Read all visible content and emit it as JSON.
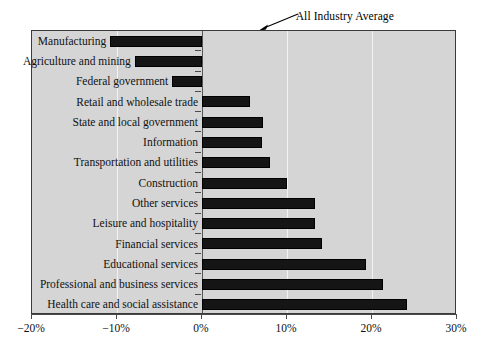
{
  "chart_data": {
    "type": "bar",
    "orientation": "horizontal",
    "title": "",
    "xlabel": "",
    "ylabel": "",
    "xlim": [
      -20,
      30
    ],
    "xticks": [
      -20,
      -10,
      0,
      10,
      20,
      30
    ],
    "xtick_labels": [
      "−20%",
      "−10%",
      "0%",
      "10%",
      "20%",
      "30%"
    ],
    "grid": true,
    "grid_axis": "x",
    "legend": "none",
    "categories": [
      "Manufacturing",
      "Agriculture and mining",
      "Federal government",
      "Retail and wholesale trade",
      "State and local government",
      "Information",
      "Transportation and utilities",
      "Construction",
      "Other services",
      "Leisure and hospitality",
      "Financial services",
      "Educational services",
      "Professional and business services",
      "Health care and social assistance"
    ],
    "values": [
      -10.8,
      -7.9,
      -3.5,
      5.6,
      7.2,
      7.0,
      8.0,
      10.0,
      13.3,
      13.3,
      14.1,
      19.3,
      21.3,
      24.1
    ],
    "annotations": [
      {
        "text": "All Industry Average",
        "points_to_x": 10.2,
        "arrow": true
      }
    ],
    "colors": {
      "bar": "#151515",
      "plot_background": "#d5d5d5",
      "gridline": "#f2f2f2",
      "zero_line": "#565656",
      "axis": "#4a4a4a",
      "text": "#111111",
      "page_background": "#ffffff"
    }
  }
}
